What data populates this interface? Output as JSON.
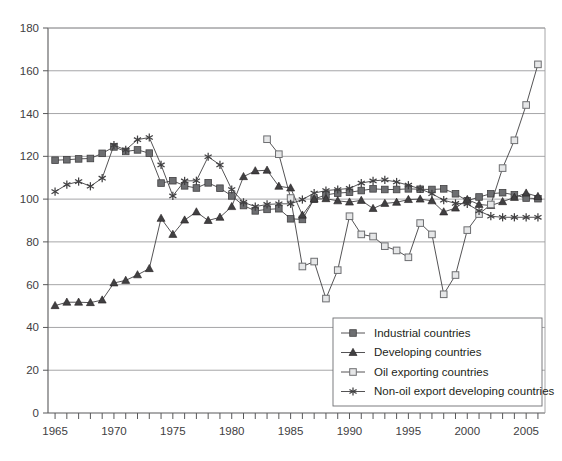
{
  "chart_data": {
    "type": "line",
    "title": "",
    "subtitle": "",
    "xlabel": "",
    "ylabel": "",
    "xlim": [
      1964.4,
      2006.6
    ],
    "ylim": [
      0,
      180
    ],
    "x_tick_step": 1,
    "x_label_step": 5,
    "y_tick_step": 20,
    "grid": true,
    "grid_axis": "y",
    "legend_position": "bottom-right",
    "x_tick_labels": [
      "1965",
      "1970",
      "1975",
      "1980",
      "1985",
      "1990",
      "1995",
      "2000",
      "2005"
    ],
    "y_tick_labels": [
      "0",
      "20",
      "40",
      "60",
      "80",
      "100",
      "120",
      "140",
      "160",
      "180"
    ],
    "x": [
      1965,
      1966,
      1967,
      1968,
      1969,
      1970,
      1971,
      1972,
      1973,
      1974,
      1975,
      1976,
      1977,
      1978,
      1979,
      1980,
      1981,
      1982,
      1983,
      1984,
      1985,
      1986,
      1987,
      1988,
      1989,
      1990,
      1991,
      1992,
      1993,
      1994,
      1995,
      1996,
      1997,
      1998,
      1999,
      2000,
      2001,
      2002,
      2003,
      2004,
      2005,
      2006
    ],
    "series": [
      {
        "name": "Industrial countries",
        "marker": "filled-square",
        "color": "#6d6e71",
        "values": [
          118.2,
          118.4,
          118.8,
          119.0,
          121.4,
          124.4,
          122.3,
          123.0,
          121.5,
          107.5,
          108.6,
          106.2,
          105.2,
          107.6,
          105.1,
          101.5,
          97.0,
          94.5,
          95.2,
          95.5,
          90.8,
          90.5,
          100.0,
          102.0,
          102.8,
          103.2,
          104.0,
          104.8,
          104.5,
          104.5,
          104.8,
          104.6,
          104.5,
          104.8,
          102.5,
          99.2,
          101.0,
          102.5,
          103.0,
          102.0,
          100.5,
          100.2
        ]
      },
      {
        "name": "Developing countries",
        "marker": "filled-triangle",
        "color": "#414042",
        "values": [
          50.2,
          51.8,
          51.8,
          51.6,
          52.8,
          60.8,
          62.0,
          64.6,
          67.5,
          91.0,
          83.5,
          90.2,
          94.0,
          90.0,
          91.5,
          96.5,
          110.5,
          113.2,
          113.5,
          106.0,
          105.2,
          92.5,
          100.0,
          100.2,
          99.2,
          98.6,
          99.4,
          95.6,
          98.0,
          98.5,
          99.8,
          100.0,
          99.2,
          94.0,
          95.8,
          99.8,
          97.5,
          97.0,
          98.8,
          100.8,
          102.8,
          101.2
        ]
      },
      {
        "name": "Oil exporting countries",
        "marker": "open-square",
        "color": "#a7a9ac",
        "values": [
          null,
          null,
          null,
          null,
          null,
          null,
          null,
          null,
          null,
          null,
          null,
          null,
          null,
          null,
          null,
          null,
          null,
          null,
          128.0,
          121.0,
          100.5,
          68.5,
          70.8,
          53.5,
          66.8,
          92.0,
          83.5,
          82.5,
          78.0,
          76.0,
          72.8,
          88.8,
          83.5,
          55.5,
          64.5,
          85.5,
          93.0,
          97.5,
          114.5,
          127.5,
          144.0,
          163.0
        ]
      },
      {
        "name": "Non-oil export developing countries",
        "marker": "asterisk",
        "color": "#414042",
        "values": [
          103.5,
          106.8,
          108.2,
          106.0,
          109.8,
          125.2,
          123.0,
          127.8,
          128.8,
          116.0,
          101.5,
          108.5,
          108.6,
          119.8,
          116.0,
          104.5,
          98.5,
          96.5,
          97.5,
          97.8,
          97.8,
          99.8,
          102.8,
          104.0,
          104.5,
          105.0,
          107.5,
          108.5,
          109.0,
          108.0,
          106.5,
          104.8,
          102.5,
          99.5,
          98.0,
          97.8,
          94.5,
          92.0,
          91.5,
          91.5,
          91.5,
          91.5
        ]
      }
    ]
  },
  "legend": {
    "entries": [
      {
        "label": "Industrial countries",
        "marker": "filled-square"
      },
      {
        "label": "Developing countries",
        "marker": "filled-triangle"
      },
      {
        "label": "Oil exporting countries",
        "marker": "open-square"
      },
      {
        "label": "Non-oil export developing countries",
        "marker": "asterisk"
      }
    ]
  }
}
